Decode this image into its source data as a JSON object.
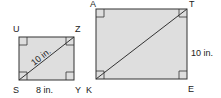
{
  "figures": [
    {
      "name": "small-rectangle",
      "vertices": {
        "top_left": "U",
        "top_right": "Z",
        "bottom_left": "S",
        "bottom_right": "Y"
      },
      "diagonal_label": "10 in.",
      "bottom_side_label": "8 in."
    },
    {
      "name": "large-rectangle",
      "vertices": {
        "top_left": "A",
        "top_right": "T",
        "bottom_left": "K",
        "bottom_right": "E"
      },
      "right_side_label": "10 in."
    }
  ],
  "colors": {
    "fill": "#dedede",
    "stroke": "#333333"
  }
}
